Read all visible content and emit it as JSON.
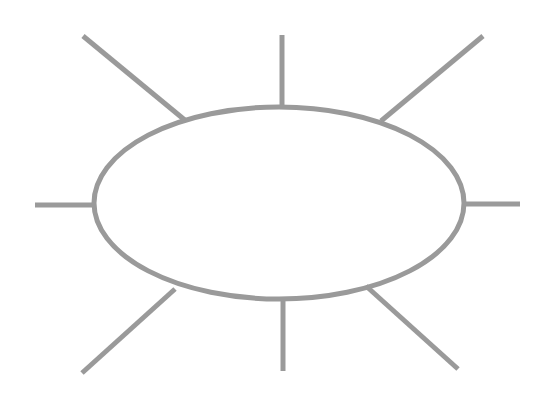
{
  "diagram": {
    "type": "spider-map",
    "stroke_color": "#9a9a9a",
    "background": "#ffffff",
    "center_ellipse": {
      "cx": 279,
      "cy": 203,
      "rx": 185,
      "ry": 96,
      "stroke_width": 5,
      "label": ""
    },
    "spokes": [
      {
        "id": "top-left",
        "x1": 186,
        "y1": 121,
        "x2": 83,
        "y2": 36,
        "label": ""
      },
      {
        "id": "top",
        "x1": 282,
        "y1": 107,
        "x2": 282,
        "y2": 35,
        "label": ""
      },
      {
        "id": "top-right",
        "x1": 381,
        "y1": 121,
        "x2": 483,
        "y2": 36,
        "label": ""
      },
      {
        "id": "right",
        "x1": 464,
        "y1": 204,
        "x2": 520,
        "y2": 204,
        "label": ""
      },
      {
        "id": "bottom-right",
        "x1": 366,
        "y1": 286,
        "x2": 458,
        "y2": 369,
        "label": ""
      },
      {
        "id": "bottom",
        "x1": 283,
        "y1": 299,
        "x2": 283,
        "y2": 371,
        "label": ""
      },
      {
        "id": "bottom-left",
        "x1": 175,
        "y1": 289,
        "x2": 82,
        "y2": 373,
        "label": ""
      },
      {
        "id": "left",
        "x1": 35,
        "y1": 205,
        "x2": 94,
        "y2": 205,
        "label": ""
      }
    ],
    "spoke_width": 5
  }
}
